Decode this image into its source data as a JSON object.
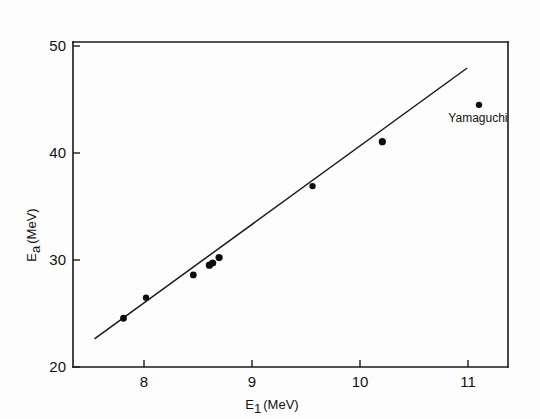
{
  "chart_data": {
    "type": "scatter",
    "title": "",
    "xlabel": "E₁ (MeV)",
    "xlabel_base": "E",
    "xlabel_sub": "1",
    "xlabel_unit": "(MeV)",
    "ylabel": "Eₐ (MeV)",
    "ylabel_base": "E",
    "ylabel_sub": "a",
    "ylabel_unit": "(MeV)",
    "xlim": [
      7.25,
      11.3
    ],
    "ylim": [
      20,
      50
    ],
    "xticks": [
      8,
      9,
      10,
      11
    ],
    "xtick_labels": [
      "8",
      "9",
      "10",
      "11"
    ],
    "yticks": [
      20,
      30,
      40,
      50
    ],
    "ytick_labels": [
      "20",
      "30",
      "40",
      "50"
    ],
    "grid": false,
    "legend": false,
    "points": [
      {
        "x": 7.72,
        "y": 24.5,
        "r": 3.4
      },
      {
        "x": 7.93,
        "y": 26.4,
        "r": 3.2
      },
      {
        "x": 8.37,
        "y": 28.5,
        "r": 3.4
      },
      {
        "x": 8.52,
        "y": 29.4,
        "r": 3.6
      },
      {
        "x": 8.55,
        "y": 29.6,
        "r": 3.6
      },
      {
        "x": 8.61,
        "y": 30.1,
        "r": 3.6
      },
      {
        "x": 9.48,
        "y": 36.7,
        "r": 3.2
      },
      {
        "x": 10.13,
        "y": 40.8,
        "r": 3.6
      },
      {
        "x": 11.03,
        "y": 44.2,
        "r": 3.2
      }
    ],
    "fit_line": {
      "name": "linear-fit",
      "x0": 7.45,
      "y0": 22.6,
      "x1": 10.92,
      "y1": 47.6
    },
    "annotations": [
      {
        "text": "Yamaguchi",
        "x": 11.02,
        "y": 42.6,
        "anchor": "middle"
      }
    ]
  },
  "colors": {
    "axis": "#1a1a1a",
    "point": "#0d0d0d",
    "line": "#1a1a1a",
    "background": "#fdfdfd"
  }
}
